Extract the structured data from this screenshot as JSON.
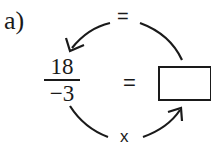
{
  "problem": {
    "label": "a)",
    "fraction": {
      "numerator": "18",
      "denominator": "−3"
    },
    "equals_sign": "=",
    "answer_box": ""
  },
  "cycle": {
    "top_operator": "=",
    "bottom_operator": "x"
  },
  "colors": {
    "ink": "#1a1a1a",
    "background": "#ffffff"
  }
}
